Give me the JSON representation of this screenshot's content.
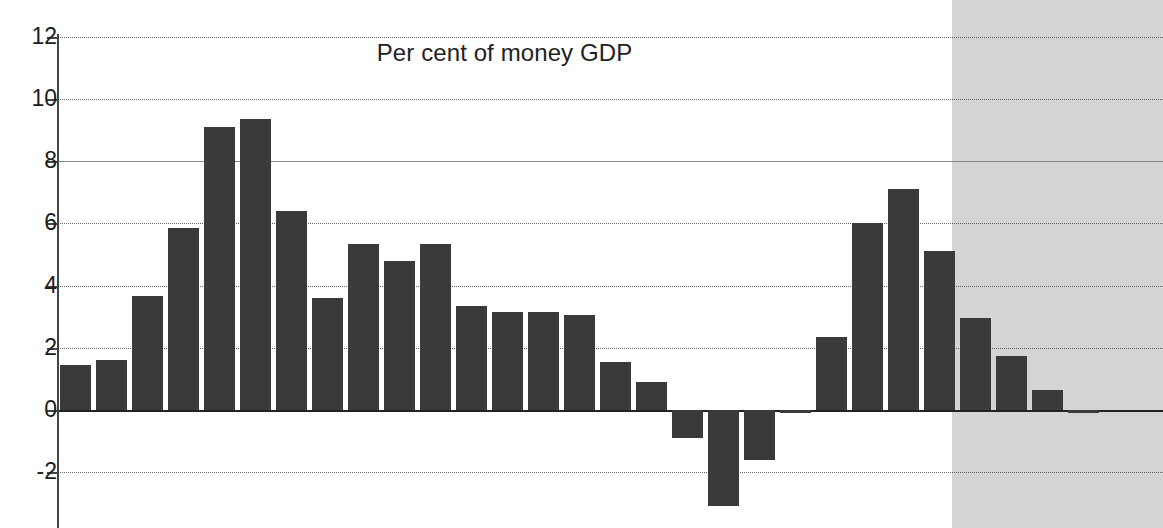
{
  "chart_data": {
    "type": "bar",
    "title": "Per cent of money GDP",
    "xlabel": "",
    "ylabel": "",
    "ylim": [
      -3.6,
      12.4
    ],
    "yticks": [
      12,
      10,
      8,
      6,
      4,
      2,
      0,
      -2
    ],
    "ytick_labels": [
      "12",
      "10",
      "8",
      "6",
      "4",
      "2",
      "0",
      "-2"
    ],
    "grid": true,
    "grid_axis": "y",
    "legend": "none",
    "zero_line": true,
    "bar_color": "#3a3a3a",
    "forecast_shade_color": "#c8c8c8",
    "forecast_start_index": 24,
    "n_bars": 29,
    "categories": [
      "1",
      "2",
      "3",
      "4",
      "5",
      "6",
      "7",
      "8",
      "9",
      "10",
      "11",
      "12",
      "13",
      "14",
      "15",
      "16",
      "17",
      "18",
      "19",
      "20",
      "21",
      "22",
      "23",
      "24",
      "25",
      "26",
      "27",
      "28",
      "29"
    ],
    "values": [
      1.45,
      1.6,
      3.65,
      5.85,
      9.1,
      9.35,
      6.4,
      3.6,
      5.35,
      4.8,
      5.35,
      3.35,
      3.15,
      3.15,
      3.05,
      1.55,
      0.9,
      -0.9,
      -3.1,
      -1.6,
      -0.1,
      2.35,
      6.0,
      7.1,
      5.1,
      2.95,
      1.75,
      0.65,
      -0.05
    ],
    "series": [
      {
        "name": "Per cent of money GDP",
        "values": [
          1.45,
          1.6,
          3.65,
          5.85,
          9.1,
          9.35,
          6.4,
          3.6,
          5.35,
          4.8,
          5.35,
          3.35,
          3.15,
          3.15,
          3.05,
          1.55,
          0.9,
          -0.9,
          -3.1,
          -1.6,
          -0.1,
          2.35,
          6.0,
          7.1,
          5.1,
          2.95,
          1.75,
          0.65,
          -0.05
        ]
      }
    ],
    "annotations": [
      {
        "name": "forecast-region",
        "type": "shaded-band",
        "starts_at_bar": 25
      }
    ]
  },
  "geometry": {
    "plot_left": 57,
    "plot_right": 1163,
    "zero_y": 410,
    "px_per_unit": 31.1,
    "bar_pitch": 36.0,
    "bar_width": 30.5,
    "first_bar_left": 60,
    "forecast_x": 952,
    "top_gridline_y": 36
  }
}
